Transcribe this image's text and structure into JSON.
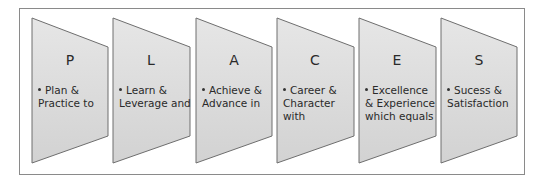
{
  "diagram": {
    "title": "",
    "items": [
      {
        "letter": "P",
        "text": "Plan & Practice to"
      },
      {
        "letter": "L",
        "text": "Learn & Leverage and"
      },
      {
        "letter": "A",
        "text": "Achieve & Advance in"
      },
      {
        "letter": "C",
        "text": "Career & Character with"
      },
      {
        "letter": "E",
        "text": "Excellence & Experience which equals"
      },
      {
        "letter": "S",
        "text": "Sucess & Satisfaction"
      }
    ],
    "colors": {
      "fill": "#dcdcdc",
      "stroke": "#6e6e6e",
      "frame": "#8a8a8a"
    }
  }
}
